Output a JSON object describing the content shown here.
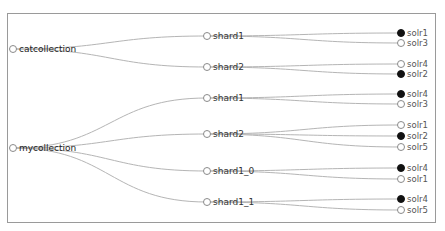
{
  "diagram": {
    "type": "cloud-graph-tree",
    "collections": [
      {
        "name": "catcollection",
        "shards": [
          {
            "name": "shard1",
            "replicas": [
              {
                "name": "solr1",
                "leader": true
              },
              {
                "name": "solr3",
                "leader": false
              }
            ]
          },
          {
            "name": "shard2",
            "replicas": [
              {
                "name": "solr4",
                "leader": false
              },
              {
                "name": "solr2",
                "leader": true
              }
            ]
          }
        ]
      },
      {
        "name": "mycollection",
        "shards": [
          {
            "name": "shard1",
            "replicas": [
              {
                "name": "solr4",
                "leader": true
              },
              {
                "name": "solr3",
                "leader": false
              }
            ]
          },
          {
            "name": "shard2",
            "replicas": [
              {
                "name": "solr1",
                "leader": false
              },
              {
                "name": "solr2",
                "leader": true
              },
              {
                "name": "solr5",
                "leader": false
              }
            ]
          },
          {
            "name": "shard1_0",
            "replicas": [
              {
                "name": "solr4",
                "leader": true
              },
              {
                "name": "solr1",
                "leader": false
              }
            ]
          },
          {
            "name": "shard1_1",
            "replicas": [
              {
                "name": "solr4",
                "leader": true
              },
              {
                "name": "solr5",
                "leader": false
              }
            ]
          }
        ]
      }
    ],
    "colors": {
      "link": "#b5b5b5",
      "leader_node": "#111111",
      "replica_node": "#ffffff",
      "frame": "#9a9a9a"
    }
  }
}
